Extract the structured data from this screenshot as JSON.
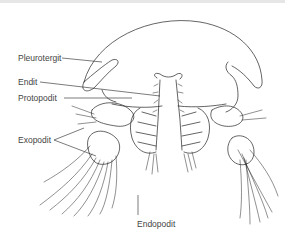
{
  "figure": {
    "labels": [
      {
        "id": "pleurotergit",
        "text": "Pleurotergit"
      },
      {
        "id": "endit",
        "text": "Endit"
      },
      {
        "id": "protopodit",
        "text": "Protopodit"
      },
      {
        "id": "exopodit",
        "text": "Exopodit"
      },
      {
        "id": "endopodit",
        "text": "Endopodit"
      }
    ]
  }
}
